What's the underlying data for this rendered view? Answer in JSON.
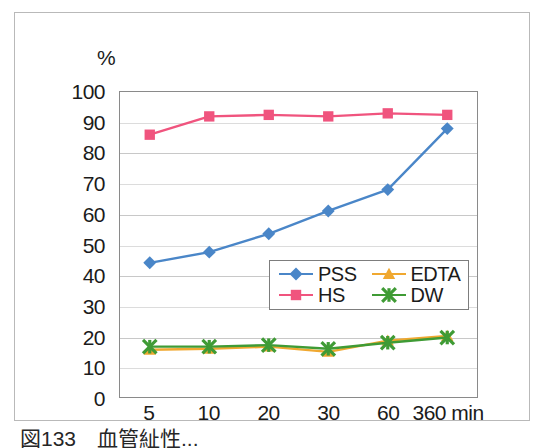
{
  "figure": {
    "unit_label": "%",
    "caption": "図133　血管䊼性..."
  },
  "legend": {
    "position": "inside-center-right",
    "entries": [
      {
        "label": "PSS",
        "color": "#4a86c8",
        "marker": "diamond"
      },
      {
        "label": "EDTA",
        "color": "#f0a830",
        "marker": "triangle"
      },
      {
        "label": "HS",
        "color": "#f0547e",
        "marker": "square"
      },
      {
        "label": "DW",
        "color": "#3f9b35",
        "marker": "cross-star"
      }
    ]
  },
  "chart_data": {
    "type": "line",
    "title": "",
    "xlabel": "",
    "ylabel": "%",
    "x_unit": "min",
    "categories": [
      "5",
      "10",
      "20",
      "30",
      "60",
      "360 min"
    ],
    "ylim": [
      0,
      100
    ],
    "ytick_step": 10,
    "yticks": [
      "100",
      "90",
      "80",
      "70",
      "60",
      "50",
      "40",
      "30",
      "20",
      "10",
      "0"
    ],
    "grid": true,
    "series": [
      {
        "name": "PSS",
        "color": "#4a86c8",
        "marker": "diamond",
        "values": [
          44,
          47.5,
          53.5,
          61,
          68,
          88
        ]
      },
      {
        "name": "HS",
        "color": "#f0547e",
        "marker": "square",
        "values": [
          86,
          92,
          92.5,
          92,
          93,
          92.5
        ]
      },
      {
        "name": "EDTA",
        "color": "#f0a830",
        "marker": "triangle",
        "values": [
          15.5,
          15.8,
          16.5,
          14.8,
          18.5,
          20
        ]
      },
      {
        "name": "DW",
        "color": "#3f9b35",
        "marker": "cross-star",
        "values": [
          16.5,
          16.5,
          17,
          15.8,
          17.8,
          19.5
        ]
      }
    ]
  }
}
